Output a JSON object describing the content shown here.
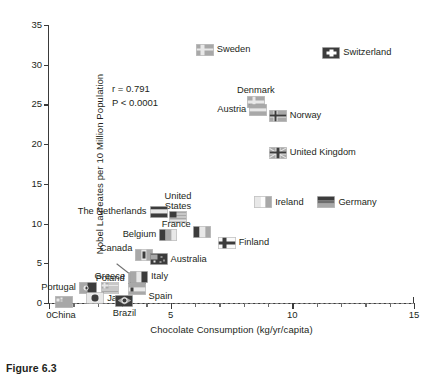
{
  "figure": {
    "caption": "Figure 6.3"
  },
  "chart_data": {
    "type": "scatter",
    "title": "",
    "xlabel": "Chocolate Consumption (kg/yr/capita)",
    "ylabel": "Nobel Laureates per 10 Million Population",
    "xlim": [
      0,
      15
    ],
    "ylim": [
      0,
      35
    ],
    "xticks": [
      0,
      5,
      10,
      15
    ],
    "xtick_labels": [
      "0",
      "5",
      "10",
      "15"
    ],
    "xminor_step": 1,
    "yticks": [
      0,
      5,
      10,
      15,
      20,
      25,
      30,
      35
    ],
    "ytick_labels": [
      "0",
      "5",
      "10",
      "15",
      "20",
      "25",
      "30",
      "35"
    ],
    "grid": false,
    "legend": "none",
    "marker_style": "country-flag",
    "annotations": {
      "correlation": "r = 0.791",
      "pvalue": "P < 0.0001"
    },
    "points": [
      {
        "label": "Sweden",
        "x": 6.4,
        "y": 31.9
      },
      {
        "label": "Switzerland",
        "x": 11.6,
        "y": 31.5
      },
      {
        "label": "Denmark",
        "x": 8.5,
        "y": 25.3
      },
      {
        "label": "Austria",
        "x": 8.6,
        "y": 24.3
      },
      {
        "label": "Norway",
        "x": 9.4,
        "y": 23.6
      },
      {
        "label": "United Kingdom",
        "x": 9.4,
        "y": 18.9
      },
      {
        "label": "Ireland",
        "x": 8.8,
        "y": 12.7
      },
      {
        "label": "Germany",
        "x": 11.4,
        "y": 12.7
      },
      {
        "label": "United States",
        "x": 5.3,
        "y": 10.8
      },
      {
        "label": "The Netherlands",
        "x": 4.5,
        "y": 11.5
      },
      {
        "label": "France",
        "x": 6.3,
        "y": 9.0
      },
      {
        "label": "Belgium",
        "x": 4.9,
        "y": 8.6
      },
      {
        "label": "Finland",
        "x": 7.3,
        "y": 7.6
      },
      {
        "label": "Canada",
        "x": 3.9,
        "y": 6.0
      },
      {
        "label": "Australia",
        "x": 4.5,
        "y": 5.5
      },
      {
        "label": "Poland",
        "x": 3.6,
        "y": 3.1
      },
      {
        "label": "Italy",
        "x": 3.7,
        "y": 3.3
      },
      {
        "label": "Spain",
        "x": 3.6,
        "y": 1.7
      },
      {
        "label": "Greece",
        "x": 2.5,
        "y": 1.9
      },
      {
        "label": "Portugal",
        "x": 1.6,
        "y": 1.9
      },
      {
        "label": "China",
        "x": 0.6,
        "y": 0.1
      },
      {
        "label": "Japan",
        "x": 1.9,
        "y": 0.6
      },
      {
        "label": "Brazil",
        "x": 3.1,
        "y": 0.3
      }
    ]
  },
  "labels": {
    "sweden": "Sweden",
    "switzerland": "Switzerland",
    "denmark": "Denmark",
    "austria": "Austria",
    "norway": "Norway",
    "united_kingdom": "United Kingdom",
    "ireland": "Ireland",
    "germany": "Germany",
    "united_states_l1": "United",
    "united_states_l2": "States",
    "netherlands": "The Netherlands",
    "france": "France",
    "belgium": "Belgium",
    "finland": "Finland",
    "canada": "Canada",
    "australia": "Australia",
    "poland": "Poland",
    "italy": "Italy",
    "spain": "Spain",
    "greece": "Greece",
    "portugal": "Portugal",
    "china": "China",
    "japan": "Japan",
    "brazil": "Brazil"
  },
  "colors": {
    "text": "#231f20",
    "axis": "#3a3a3a",
    "zero_line": "#8d8d8d",
    "flag_light": "#e8e8e8",
    "flag_mid": "#a8a8a8",
    "flag_dark": "#3c3c3c"
  }
}
